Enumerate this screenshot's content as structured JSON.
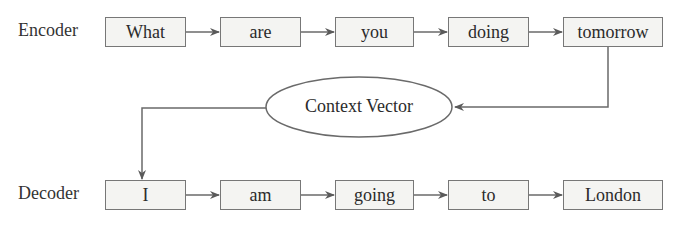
{
  "diagram": {
    "encoder": {
      "label": "Encoder",
      "tokens": [
        "What",
        "are",
        "you",
        "doing",
        "tomorrow"
      ]
    },
    "context": {
      "label": "Context Vector"
    },
    "decoder": {
      "label": "Decoder",
      "tokens": [
        "I",
        "am",
        "going",
        "to",
        "London"
      ]
    },
    "colors": {
      "line": "#6a6a6a",
      "box_border": "#777777",
      "box_fill": "#f4f4f2",
      "text": "#2b2b2b"
    }
  }
}
